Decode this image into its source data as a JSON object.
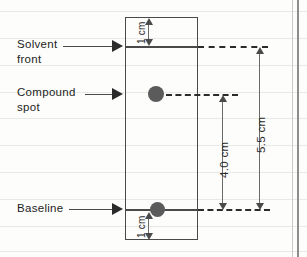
{
  "diagram": {
    "callouts": [
      {
        "name": "solvent-front",
        "line1": "Solvent",
        "line2": "front"
      },
      {
        "name": "compound-spot",
        "line1": "Compound",
        "line2": "spot"
      },
      {
        "name": "baseline",
        "line1": "Baseline",
        "line2": ""
      }
    ],
    "dimensions": {
      "top_margin": "1 cm",
      "bottom_margin": "1 cm",
      "spot_travel": "4.0 cm",
      "solvent_travel": "5.5 cm"
    },
    "spots": [
      {
        "name": "compound-spot-marker"
      },
      {
        "name": "baseline-spot-marker"
      }
    ],
    "colors": {
      "ink": "#2b2b2b",
      "plate_border": "#4a4a4a",
      "spot_fill": "#5b5b5b",
      "rule_line": "#e9e9e6",
      "page_edge": "#8d8d8d",
      "paper": "#fdfdfc"
    }
  }
}
